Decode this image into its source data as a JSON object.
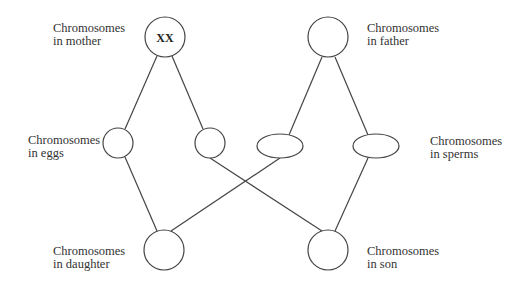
{
  "diagram": {
    "colors": {
      "stroke": "#444444",
      "text": "#333333",
      "background": "#ffffff"
    },
    "labels": {
      "mother": {
        "line1": "Chromosomes",
        "line2": "in mother"
      },
      "father": {
        "line1": "Chromosomes",
        "line2": "in father"
      },
      "eggs": {
        "line1": "Chromosomes",
        "line2": "in eggs"
      },
      "sperms": {
        "line1": "Chromosomes",
        "line2": "in sperms"
      },
      "daughter": {
        "line1": "Chromosomes",
        "line2": "in daughter"
      },
      "son": {
        "line1": "Chromosomes",
        "line2": "in son"
      }
    },
    "nodes": {
      "mother": {
        "shape": "circle",
        "text": "XX"
      },
      "father": {
        "shape": "circle",
        "text": ""
      },
      "egg_1": {
        "shape": "circle",
        "text": ""
      },
      "egg_2": {
        "shape": "circle",
        "text": ""
      },
      "sperm_1": {
        "shape": "ellipse",
        "text": ""
      },
      "sperm_2": {
        "shape": "ellipse",
        "text": ""
      },
      "daughter": {
        "shape": "circle",
        "text": ""
      },
      "son": {
        "shape": "circle",
        "text": ""
      }
    },
    "edges": [
      [
        "mother",
        "egg_1"
      ],
      [
        "mother",
        "egg_2"
      ],
      [
        "father",
        "sperm_1"
      ],
      [
        "father",
        "sperm_2"
      ],
      [
        "egg_1",
        "daughter"
      ],
      [
        "sperm_1",
        "daughter"
      ],
      [
        "egg_2",
        "son"
      ],
      [
        "sperm_2",
        "son"
      ]
    ]
  }
}
